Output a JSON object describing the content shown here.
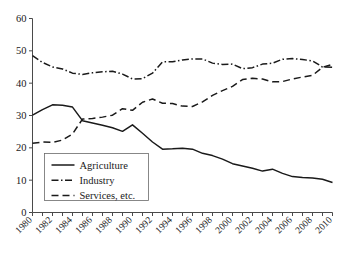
{
  "chart_data": {
    "type": "line",
    "title": "",
    "subtitle": "",
    "xlabel": "",
    "ylabel": "",
    "xlim": [
      1980,
      2010
    ],
    "ylim": [
      0,
      60
    ],
    "yticks": [
      0,
      10,
      20,
      30,
      40,
      50,
      60
    ],
    "xticks": [
      1980,
      1982,
      1984,
      1986,
      1988,
      1990,
      1992,
      1994,
      1996,
      1998,
      2000,
      2002,
      2004,
      2006,
      2008,
      2010
    ],
    "grid": false,
    "legend_position": "lower-left",
    "x": [
      1980,
      1981,
      1982,
      1983,
      1984,
      1985,
      1986,
      1987,
      1988,
      1989,
      1990,
      1991,
      1992,
      1993,
      1994,
      1995,
      1996,
      1997,
      1998,
      1999,
      2000,
      2001,
      2002,
      2003,
      2004,
      2005,
      2006,
      2007,
      2008,
      2009,
      2010
    ],
    "series": [
      {
        "name": "Agriculture",
        "style": "solid",
        "values": [
          30.1,
          31.8,
          33.3,
          33.2,
          32.6,
          28.4,
          27.7,
          27.0,
          26.2,
          25.1,
          27.1,
          24.5,
          21.8,
          19.6,
          19.7,
          19.9,
          19.6,
          18.3,
          17.6,
          16.5,
          15.1,
          14.4,
          13.7,
          12.8,
          13.4,
          12.1,
          11.1,
          10.8,
          10.7,
          10.3,
          9.3
        ]
      },
      {
        "name": "Industry",
        "style": "dashdot",
        "values": [
          48.5,
          46.4,
          45.0,
          44.4,
          43.1,
          42.7,
          43.2,
          43.5,
          43.7,
          42.8,
          41.3,
          41.4,
          43.1,
          46.6,
          46.6,
          47.2,
          47.5,
          47.5,
          46.2,
          45.8,
          45.9,
          44.5,
          44.8,
          45.9,
          46.2,
          47.4,
          47.6,
          47.3,
          46.9,
          45.0,
          44.9
        ]
      },
      {
        "name": "Services, etc.",
        "style": "dashed",
        "values": [
          21.4,
          21.8,
          21.7,
          22.4,
          24.3,
          28.9,
          29.1,
          29.5,
          30.1,
          32.1,
          31.6,
          34.1,
          35.1,
          33.8,
          33.7,
          32.9,
          32.8,
          34.2,
          36.2,
          37.7,
          39.0,
          41.1,
          41.5,
          41.3,
          40.4,
          40.5,
          41.3,
          41.9,
          42.4,
          44.9,
          45.8
        ]
      }
    ],
    "colors": {
      "line": "#1a1a1a",
      "axis": "#4a4a4a",
      "background": "#ffffff"
    }
  },
  "legend": {
    "entries": [
      {
        "label": "Agriculture"
      },
      {
        "label": "Industry"
      },
      {
        "label": "Services, etc."
      }
    ]
  }
}
